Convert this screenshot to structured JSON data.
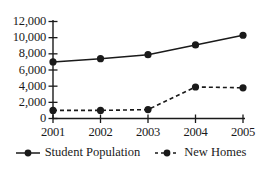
{
  "chart_data": {
    "type": "line",
    "title": "",
    "xlabel": "",
    "ylabel": "",
    "categories": [
      "2001",
      "2002",
      "2003",
      "2004",
      "2005"
    ],
    "ylim": [
      0,
      12000
    ],
    "yticks": [
      0,
      2000,
      4000,
      6000,
      8000,
      10000,
      12000
    ],
    "ytick_labels": [
      "0",
      "2,000",
      "4,000",
      "6,000",
      "8,000",
      "10,000",
      "12,000"
    ],
    "grid": false,
    "legend_position": "bottom",
    "series": [
      {
        "name": "Student Population",
        "values": [
          7000,
          7400,
          7900,
          9100,
          10300
        ],
        "line_style": "solid",
        "marker": "circle",
        "color": "#1a1a1a"
      },
      {
        "name": "New Homes",
        "values": [
          1000,
          1000,
          1100,
          3900,
          3800
        ],
        "line_style": "dashed",
        "marker": "circle",
        "color": "#1a1a1a"
      }
    ]
  },
  "legend": {
    "entries": [
      {
        "label": "Student Population",
        "style": "solid"
      },
      {
        "label": "New Homes",
        "style": "dashed"
      }
    ]
  },
  "axis": {
    "origin_label": "0"
  }
}
